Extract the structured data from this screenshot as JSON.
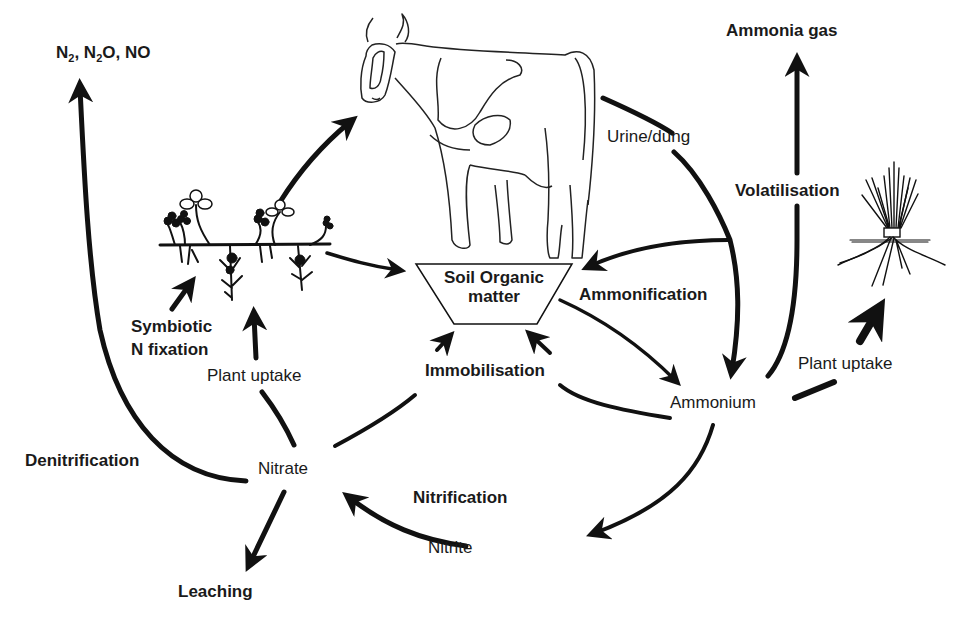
{
  "diagram": {
    "nodes": {
      "gases": {
        "parts": [
          "N",
          "2",
          ", N",
          "2",
          "O, NO"
        ],
        "full": "N2, N2O, NO"
      },
      "ammonia_gas": "Ammonia gas",
      "soil_organic_matter_line1": "Soil Organic",
      "soil_organic_matter_line2": "matter",
      "ammonium": "Ammonium",
      "nitrate": "Nitrate",
      "nitrite": "Nitrite",
      "leaching": "Leaching"
    },
    "processes": {
      "urine_dung": "Urine/dung",
      "volatilisation": "Volatilisation",
      "ammonification": "Ammonification",
      "immobilisation": "Immobilisation",
      "symbiotic_line1": "Symbiotic",
      "symbiotic_line2": "N fixation",
      "plant_uptake_left": "Plant uptake",
      "plant_uptake_right": "Plant uptake",
      "denitrification": "Denitrification",
      "nitrification": "Nitrification"
    },
    "illustrations": {
      "cow": "cow-illustration",
      "clover": "clover-plant-illustration",
      "grass": "grass-tuft-illustration"
    },
    "colors": {
      "ink": "#111111",
      "background": "#ffffff"
    }
  }
}
